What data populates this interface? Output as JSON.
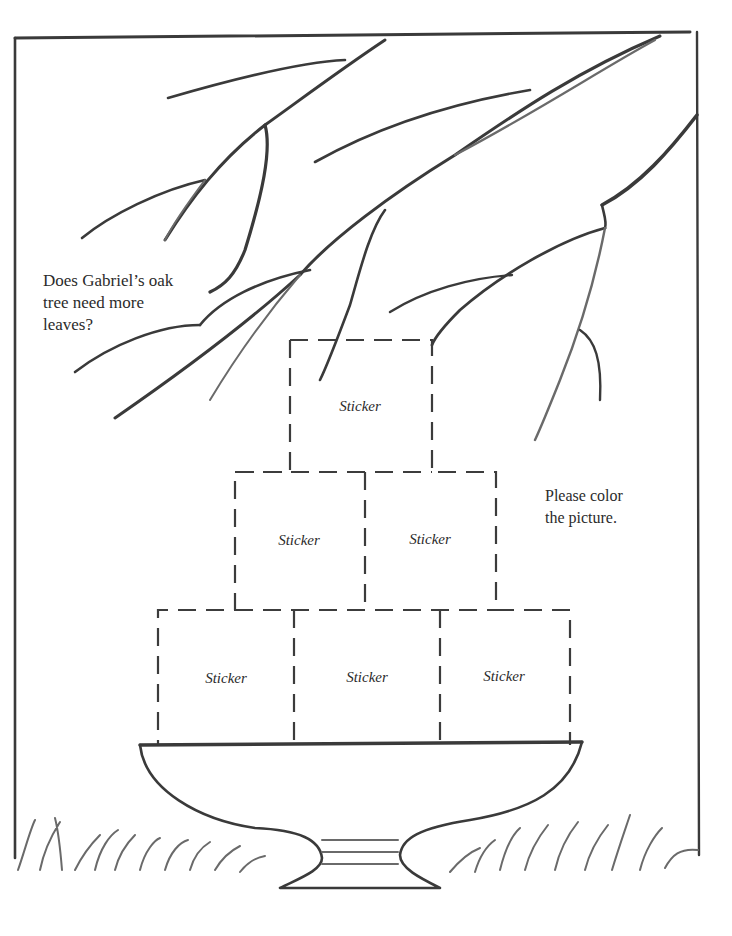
{
  "page": {
    "type": "coloring-sheet",
    "background": "#ffffff",
    "ink_color": "#3a3a3a"
  },
  "captions": {
    "question": {
      "lines": [
        "Does Gabriel’s oak",
        "tree need more",
        "leaves?"
      ]
    },
    "instruction": {
      "lines": [
        "Please color",
        "the picture."
      ]
    }
  },
  "sticker_grid": {
    "rows": [
      {
        "row": 1,
        "slots": [
          {
            "label": "Sticker"
          }
        ]
      },
      {
        "row": 2,
        "slots": [
          {
            "label": "Sticker"
          },
          {
            "label": "Sticker"
          }
        ]
      },
      {
        "row": 3,
        "slots": [
          {
            "label": "Sticker"
          },
          {
            "label": "Sticker"
          },
          {
            "label": "Sticker"
          }
        ]
      }
    ]
  },
  "drawing": {
    "elements": [
      "frame",
      "oak-branches",
      "pedestal-bowl",
      "grass"
    ]
  }
}
